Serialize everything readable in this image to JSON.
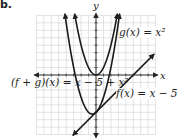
{
  "figure": {
    "part_label": "b.",
    "axis_x_label": "x",
    "axis_y_label": "y",
    "labels": {
      "g": "g(x) = x²",
      "f": "f(x) = x − 5",
      "sum": "(f + g)(x) = x − 5 + x²"
    }
  },
  "colors": {
    "curve": "#1a1a1a",
    "grid": "#d0d0d0",
    "axis": "#333333"
  },
  "chart_data": {
    "type": "line",
    "title": "",
    "xlabel": "x",
    "ylabel": "y",
    "xlim": [
      -8,
      8
    ],
    "ylim": [
      -8,
      8
    ],
    "grid": true,
    "series": [
      {
        "name": "g(x) = x^2",
        "expr": "x^2",
        "vertex": [
          0,
          0
        ]
      },
      {
        "name": "f(x) = x - 5",
        "expr": "x - 5",
        "y_intercept": -5,
        "x_intercept": 5
      },
      {
        "name": "(f + g)(x) = x - 5 + x^2",
        "expr": "x^2 + x - 5",
        "vertex": [
          -0.5,
          -5.25
        ]
      }
    ]
  }
}
